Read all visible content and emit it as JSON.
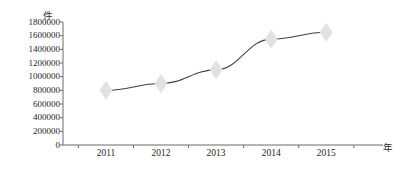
{
  "chart_data": {
    "type": "line",
    "title": "",
    "subtitle": "",
    "xlabel": "年",
    "ylabel": "件",
    "categories": [
      "2011",
      "2012",
      "2013",
      "2014",
      "2015"
    ],
    "x": [
      2011,
      2012,
      2013,
      2014,
      2015
    ],
    "series": [
      {
        "name": "",
        "values": [
          800000,
          900000,
          1100000,
          1550000,
          1650000
        ]
      }
    ],
    "ylim": [
      0,
      1800000
    ],
    "ytick_labels": [
      "1800000",
      "1600000",
      "1400000",
      "1200000",
      "1000000",
      "800000",
      "600000",
      "400000",
      "200000",
      "0"
    ],
    "ytick_values": [
      1800000,
      1600000,
      1400000,
      1200000,
      1000000,
      800000,
      600000,
      400000,
      200000,
      0
    ],
    "ytick_step": 200000,
    "grid": false,
    "legend": false,
    "legend_position": "none",
    "marker": "diamond",
    "marker_color": "#e2e2e2",
    "line_color": "#3f3f3f",
    "axis_color": "#6b6b6b",
    "background": "#ffffff",
    "annotations": []
  }
}
